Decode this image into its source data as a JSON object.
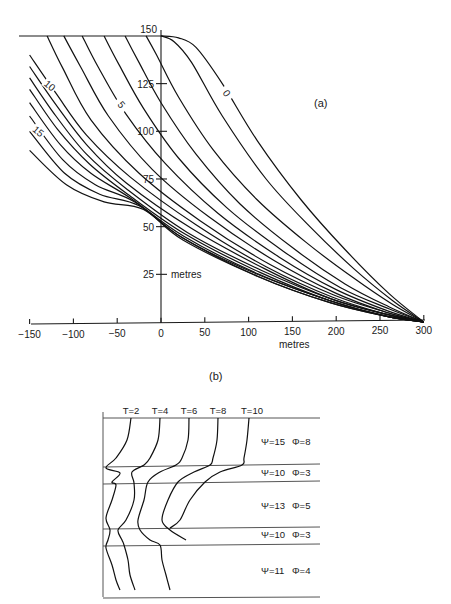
{
  "chart_data": [
    {
      "panel": "(a)",
      "type": "line",
      "title": "(a)",
      "xlabel": "metres",
      "ylabel": "metres",
      "xlim": [
        -150,
        300
      ],
      "ylim": [
        0,
        150
      ],
      "x_ticks": [
        -150,
        -100,
        -50,
        0,
        50,
        100,
        150,
        200,
        250,
        300
      ],
      "y_ticks": [
        25,
        50,
        75,
        100,
        125,
        150
      ],
      "grid": false,
      "curve_labels": [
        {
          "text": "0",
          "x": 75,
          "y": 120,
          "rotate": 55
        },
        {
          "text": "5",
          "x": -45,
          "y": 114,
          "rotate": 50
        },
        {
          "text": "10",
          "x": -127,
          "y": 124,
          "rotate": 40
        },
        {
          "text": "15",
          "x": -140,
          "y": 100,
          "rotate": 40
        }
      ],
      "series": [
        {
          "name": "0",
          "points": [
            [
              0,
              150
            ],
            [
              20,
              149
            ],
            [
              40,
              144
            ],
            [
              70,
              125
            ],
            [
              110,
              95
            ],
            [
              160,
              64
            ],
            [
              210,
              38
            ],
            [
              260,
              15
            ],
            [
              300,
              0
            ]
          ]
        },
        {
          "name": "1",
          "points": [
            [
              0,
              150
            ],
            [
              15,
              147
            ],
            [
              35,
              136
            ],
            [
              70,
              108
            ],
            [
              120,
              75
            ],
            [
              170,
              50
            ],
            [
              220,
              28
            ],
            [
              265,
              11
            ],
            [
              300,
              0
            ]
          ]
        },
        {
          "name": "2",
          "points": [
            [
              -17,
              150
            ],
            [
              -5,
              140
            ],
            [
              20,
              118
            ],
            [
              60,
              90
            ],
            [
              110,
              64
            ],
            [
              165,
              42
            ],
            [
              220,
              23
            ],
            [
              265,
              9
            ],
            [
              300,
              0
            ]
          ]
        },
        {
          "name": "3",
          "points": [
            [
              -41,
              150
            ],
            [
              -25,
              136
            ],
            [
              0,
              115
            ],
            [
              40,
              88
            ],
            [
              90,
              62
            ],
            [
              150,
              39
            ],
            [
              210,
              20
            ],
            [
              260,
              8
            ],
            [
              300,
              0
            ]
          ]
        },
        {
          "name": "4",
          "points": [
            [
              -65,
              150
            ],
            [
              -48,
              135
            ],
            [
              -20,
              112
            ],
            [
              20,
              86
            ],
            [
              75,
              60
            ],
            [
              140,
              37
            ],
            [
              205,
              18
            ],
            [
              260,
              7
            ],
            [
              300,
              0
            ]
          ]
        },
        {
          "name": "5",
          "points": [
            [
              -90,
              150
            ],
            [
              -72,
              134
            ],
            [
              -40,
              109
            ],
            [
              5,
              83
            ],
            [
              65,
              57
            ],
            [
              135,
              34
            ],
            [
              200,
              17
            ],
            [
              258,
              6
            ],
            [
              300,
              0
            ]
          ]
        },
        {
          "name": "6",
          "points": [
            [
              -111,
              150
            ],
            [
              -92,
              134
            ],
            [
              -60,
              108
            ],
            [
              -10,
              80
            ],
            [
              55,
              55
            ],
            [
              130,
              32
            ],
            [
              200,
              15
            ],
            [
              258,
              5
            ],
            [
              300,
              0
            ]
          ]
        },
        {
          "name": "7",
          "points": [
            [
              -130,
              150
            ],
            [
              -112,
              133
            ],
            [
              -80,
              106
            ],
            [
              -25,
              78
            ],
            [
              45,
              53
            ],
            [
              125,
              30
            ],
            [
              198,
              14
            ],
            [
              258,
              5
            ],
            [
              300,
              0
            ]
          ]
        },
        {
          "name": "8",
          "points": [
            [
              -150,
              140
            ],
            [
              -120,
              120
            ],
            [
              -85,
              98
            ],
            [
              -35,
              76
            ],
            [
              40,
              51
            ],
            [
              120,
              29
            ],
            [
              196,
              13
            ],
            [
              258,
              4
            ],
            [
              300,
              0
            ]
          ]
        },
        {
          "name": "9",
          "points": [
            [
              -150,
              134
            ],
            [
              -120,
              114
            ],
            [
              -85,
              93
            ],
            [
              -40,
              73
            ],
            [
              35,
              49
            ],
            [
              118,
              28
            ],
            [
              195,
              12
            ],
            [
              258,
              4
            ],
            [
              300,
              0
            ]
          ]
        },
        {
          "name": "10",
          "points": [
            [
              -150,
              128
            ],
            [
              -120,
              108
            ],
            [
              -85,
              88
            ],
            [
              -40,
              70
            ],
            [
              30,
              47
            ],
            [
              115,
              27
            ],
            [
              195,
              12
            ],
            [
              258,
              4
            ],
            [
              300,
              0
            ]
          ]
        },
        {
          "name": "11",
          "points": [
            [
              -150,
              122
            ],
            [
              -118,
              101
            ],
            [
              -82,
              83
            ],
            [
              -38,
              67
            ],
            [
              28,
              46
            ],
            [
              113,
              26
            ],
            [
              194,
              11
            ],
            [
              258,
              3
            ],
            [
              300,
              0
            ]
          ]
        },
        {
          "name": "12",
          "points": [
            [
              -150,
              115
            ],
            [
              -115,
              93
            ],
            [
              -80,
              78
            ],
            [
              -35,
              65
            ],
            [
              26,
              45
            ],
            [
              112,
              25
            ],
            [
              194,
              11
            ],
            [
              258,
              3
            ],
            [
              300,
              0
            ]
          ]
        },
        {
          "name": "13",
          "points": [
            [
              -150,
              108
            ],
            [
              -112,
              85
            ],
            [
              -75,
              72
            ],
            [
              -30,
              63
            ],
            [
              25,
              44
            ],
            [
              110,
              25
            ],
            [
              194,
              11
            ],
            [
              258,
              3
            ],
            [
              300,
              0
            ]
          ]
        },
        {
          "name": "14",
          "points": [
            [
              -150,
              100
            ],
            [
              -110,
              78
            ],
            [
              -70,
              67
            ],
            [
              -25,
              61
            ],
            [
              25,
              44
            ],
            [
              110,
              24
            ],
            [
              194,
              10
            ],
            [
              258,
              3
            ],
            [
              300,
              0
            ]
          ]
        },
        {
          "name": "15",
          "points": [
            [
              -150,
              90
            ],
            [
              -108,
              72
            ],
            [
              -65,
              63
            ],
            [
              -20,
              59
            ],
            [
              25,
              43
            ],
            [
              110,
              24
            ],
            [
              194,
              10
            ],
            [
              258,
              3
            ],
            [
              300,
              0
            ]
          ]
        }
      ],
      "annotations": [
        "metres (y-axis, beside 25)",
        "metres (x-axis, below 150)"
      ]
    },
    {
      "panel": "(b)",
      "type": "line",
      "title": "(b)",
      "column_labels": [
        "T=2",
        "T=4",
        "T=6",
        "T=8",
        "T=10"
      ],
      "layers": [
        {
          "label_psi": "Ψ=15",
          "label_phi": "Φ=8"
        },
        {
          "label_psi": "Ψ=10",
          "label_phi": "Φ=3"
        },
        {
          "label_psi": "Ψ=13",
          "label_phi": "Φ=5"
        },
        {
          "label_psi": "Ψ=10",
          "label_phi": "Φ=3"
        },
        {
          "label_psi": "Ψ=11",
          "label_phi": "Φ=4"
        }
      ],
      "series_px": [
        {
          "name": "T=2",
          "points": [
            [
              131,
              418
            ],
            [
              127,
              440
            ],
            [
              116,
              458
            ],
            [
              106,
              468
            ],
            [
              120,
              473
            ],
            [
              112,
              482
            ],
            [
              116,
              485
            ],
            [
              112,
              500
            ],
            [
              106,
              518
            ],
            [
              110,
              530
            ],
            [
              108,
              540
            ],
            [
              106,
              548
            ],
            [
              112,
              565
            ],
            [
              116,
              580
            ],
            [
              120,
              590
            ]
          ]
        },
        {
          "name": "T=4",
          "points": [
            [
              160,
              418
            ],
            [
              158,
              440
            ],
            [
              150,
              458
            ],
            [
              144,
              465
            ],
            [
              132,
              472
            ],
            [
              134,
              483
            ],
            [
              134,
              500
            ],
            [
              126,
              520
            ],
            [
              118,
              530
            ],
            [
              122,
              540
            ],
            [
              124,
              545
            ],
            [
              128,
              560
            ],
            [
              130,
              575
            ],
            [
              135,
              590
            ]
          ]
        },
        {
          "name": "T=6",
          "points": [
            [
              189,
              418
            ],
            [
              188,
              440
            ],
            [
              182,
              458
            ],
            [
              176,
              465
            ],
            [
              160,
              472
            ],
            [
              148,
              482
            ],
            [
              144,
              500
            ],
            [
              138,
              520
            ],
            [
              140,
              530
            ],
            [
              150,
              540
            ],
            [
              160,
              545
            ],
            [
              162,
              560
            ],
            [
              166,
              575
            ],
            [
              170,
              590
            ]
          ]
        },
        {
          "name": "T=8",
          "points": [
            [
              218,
              418
            ],
            [
              217,
              440
            ],
            [
              213,
              458
            ],
            [
              210,
              465
            ],
            [
              194,
              472
            ],
            [
              178,
              482
            ],
            [
              168,
              500
            ],
            [
              162,
              520
            ],
            [
              170,
              530
            ],
            [
              186,
              540
            ]
          ]
        },
        {
          "name": "T=10",
          "points": [
            [
              249,
              418
            ],
            [
              247,
              440
            ],
            [
              244,
              458
            ],
            [
              242,
              465
            ],
            [
              220,
              472
            ],
            [
              205,
              482
            ],
            [
              190,
              500
            ],
            [
              180,
              520
            ],
            [
              170,
              528
            ]
          ]
        }
      ]
    }
  ],
  "labels": {
    "panel_a": "(a)",
    "panel_b": "(b)",
    "x_unit": "metres",
    "y_unit": "metres"
  }
}
